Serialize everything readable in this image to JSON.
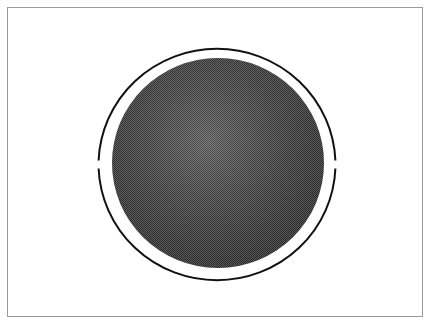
{
  "figure": {
    "colors": {
      "background": "#ffffff",
      "frame": "#9a9a9a",
      "ring": "#111111",
      "disk_light": "#8a8a8a",
      "disk_dark": "#3a3a3a"
    },
    "ring": {
      "cx": 217,
      "cy": 162,
      "rx": 118.5,
      "ry": 116.5,
      "stroke_width": 2
    },
    "disk": {
      "cx": 218,
      "cy": 163,
      "rx": 106,
      "ry": 105
    },
    "gaps": [
      {
        "side": "left",
        "x": 98,
        "y1": 161,
        "y2": 168
      },
      {
        "side": "right",
        "x": 336,
        "y1": 161,
        "y2": 168
      }
    ]
  }
}
